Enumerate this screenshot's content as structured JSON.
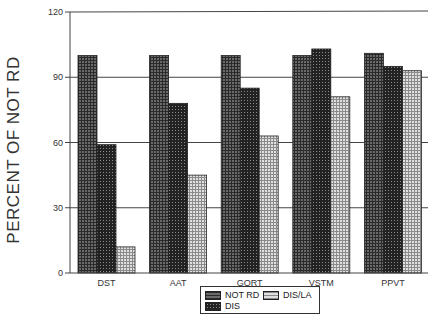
{
  "chart_data": {
    "type": "bar",
    "title": "",
    "xlabel": "",
    "ylabel": "PERCENT OF NOT RD",
    "ylim": [
      0,
      120
    ],
    "yticks": [
      0,
      30,
      60,
      90,
      120
    ],
    "grid": true,
    "legend_position": "bottom-center",
    "categories": [
      "DST",
      "AAT",
      "GORT",
      "VSTM",
      "PPVT"
    ],
    "series": [
      {
        "name": "NOT RD",
        "values": [
          100,
          100,
          100,
          100,
          101
        ],
        "pattern": "dense-grid-dark",
        "color": "#555555"
      },
      {
        "name": "DIS",
        "values": [
          59,
          78,
          85,
          103,
          95
        ],
        "pattern": "dots-dark",
        "color": "#2e2e2e"
      },
      {
        "name": "DIS/LA",
        "values": [
          12,
          45,
          63,
          81,
          93
        ],
        "pattern": "grid-light",
        "color": "#bdbdbd"
      }
    ]
  },
  "legend": {
    "items": [
      {
        "label": "NOT RD"
      },
      {
        "label": "DIS/LA"
      },
      {
        "label": "DIS"
      }
    ]
  }
}
